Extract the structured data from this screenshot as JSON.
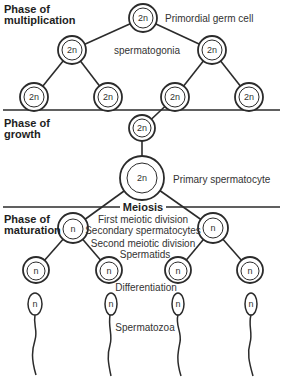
{
  "phases": {
    "multiplication": {
      "line1": "Phase of",
      "line2": "multiplication"
    },
    "growth": {
      "line1": "Phase of",
      "line2": "growth"
    },
    "maturation": {
      "line1": "Phase of",
      "line2": "maturation"
    }
  },
  "labels": {
    "primordial": "Primordial germ cell",
    "spermatogonia": "spermatogonia",
    "primary": "Primary spermatocyte",
    "meiosis": "Meiosis",
    "first_division": "First meiotic division",
    "secondary": "Secondary spermatocytes",
    "second_division": "Second meiotic division",
    "spermatids": "Spermatids",
    "differentiation": "Differentiation",
    "spermatozoa": "Spermatozoa"
  },
  "ploidy": {
    "diploid": "2n",
    "haploid": "n"
  },
  "colors": {
    "stroke": "#2b2b2b",
    "text": "#333333"
  }
}
